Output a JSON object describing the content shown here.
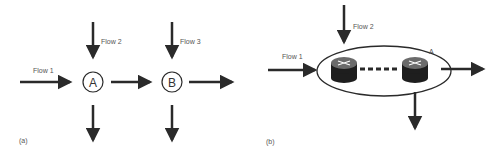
{
  "panel_a": {
    "caption": "(a)",
    "flow1": "Flow 1",
    "flow2": "Flow 2",
    "flow3": "Flow 3",
    "node_a": "A",
    "node_b": "B"
  },
  "panel_b": {
    "caption": "(b)",
    "flow1": "Flow 1",
    "flow2": "Flow 2",
    "group_label": "A"
  },
  "colors": {
    "arrow": "#2a2a2a",
    "router_top": "#6b6b6b",
    "router_body": "#1e1e1e"
  }
}
